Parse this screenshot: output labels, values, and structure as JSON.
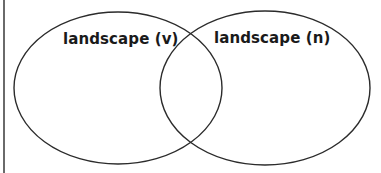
{
  "diagram": {
    "type": "venn",
    "sets": [
      {
        "id": "left",
        "label": "landscape (v)",
        "cx": 118,
        "cy": 88,
        "rx": 104,
        "ry": 76
      },
      {
        "id": "right",
        "label": "landscape (n)",
        "cx": 265,
        "cy": 88,
        "rx": 105,
        "ry": 77
      }
    ],
    "stroke_color": "#2b2b2b",
    "fill_color": "#ffffff",
    "border_color": "#6a6a6a"
  }
}
